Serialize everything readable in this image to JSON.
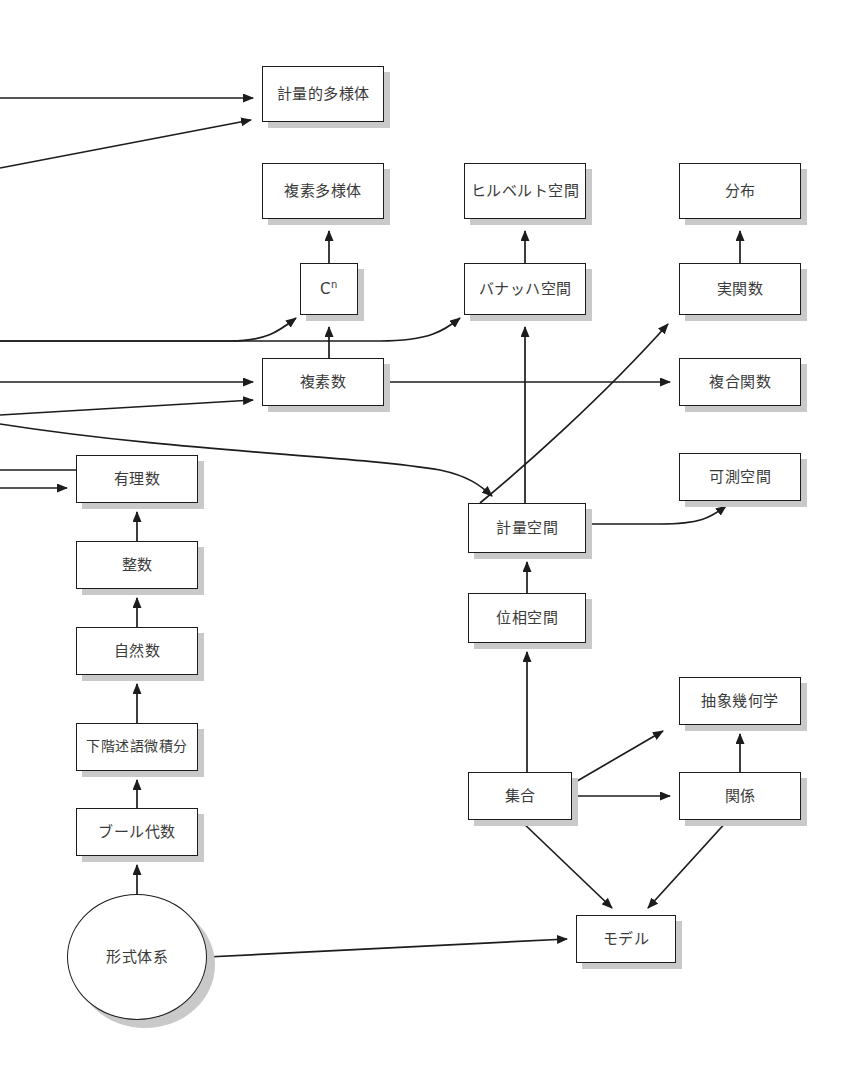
{
  "diagram": {
    "type": "dependency-graph",
    "language": "ja",
    "colors": {
      "node_fill": "#ffffff",
      "node_border": "#1c1c1c",
      "node_shadow": "#c9c9c9",
      "edge": "#1c1c1c",
      "text": "#3a3a3a",
      "background": "#ffffff"
    },
    "nodes": [
      {
        "id": "metric_manifold",
        "label": "計量的多様体",
        "shape": "rect",
        "x": 262,
        "y": 66,
        "w": 122,
        "h": 56
      },
      {
        "id": "complex_manifold",
        "label": "複素多様体",
        "shape": "rect",
        "x": 262,
        "y": 163,
        "w": 122,
        "h": 56
      },
      {
        "id": "hilbert_space",
        "label": "ヒルベルト空間",
        "shape": "rect",
        "x": 464,
        "y": 163,
        "w": 122,
        "h": 56
      },
      {
        "id": "distribution",
        "label": "分布",
        "shape": "rect",
        "x": 679,
        "y": 163,
        "w": 122,
        "h": 56
      },
      {
        "id": "cn",
        "label": "C",
        "sup": "n",
        "shape": "rect",
        "x": 300,
        "y": 263,
        "w": 58,
        "h": 52
      },
      {
        "id": "banach_space",
        "label": "バナッハ空間",
        "shape": "rect",
        "x": 464,
        "y": 263,
        "w": 122,
        "h": 52
      },
      {
        "id": "real_function",
        "label": "実関数",
        "shape": "rect",
        "x": 679,
        "y": 263,
        "w": 122,
        "h": 52
      },
      {
        "id": "complex_number",
        "label": "複素数",
        "shape": "rect",
        "x": 262,
        "y": 358,
        "w": 122,
        "h": 48
      },
      {
        "id": "composite_function",
        "label": "複合関数",
        "shape": "rect",
        "x": 679,
        "y": 358,
        "w": 122,
        "h": 48
      },
      {
        "id": "rational_number",
        "label": "有理数",
        "shape": "rect",
        "x": 76,
        "y": 455,
        "w": 122,
        "h": 48
      },
      {
        "id": "measurable_space",
        "label": "可測空間",
        "shape": "rect",
        "x": 679,
        "y": 453,
        "w": 122,
        "h": 48
      },
      {
        "id": "metric_space",
        "label": "計量空間",
        "shape": "rect",
        "x": 468,
        "y": 503,
        "w": 118,
        "h": 50
      },
      {
        "id": "integer",
        "label": "整数",
        "shape": "rect",
        "x": 76,
        "y": 541,
        "w": 122,
        "h": 48
      },
      {
        "id": "topological_space",
        "label": "位相空間",
        "shape": "rect",
        "x": 468,
        "y": 593,
        "w": 118,
        "h": 50
      },
      {
        "id": "natural_number",
        "label": "自然数",
        "shape": "rect",
        "x": 76,
        "y": 627,
        "w": 122,
        "h": 48
      },
      {
        "id": "abstract_geometry",
        "label": "抽象幾何学",
        "shape": "rect",
        "x": 679,
        "y": 677,
        "w": 122,
        "h": 48
      },
      {
        "id": "predicate_calculus",
        "label": "下階述語微積分",
        "shape": "rect",
        "x": 76,
        "y": 723,
        "w": 122,
        "h": 48
      },
      {
        "id": "set",
        "label": "集合",
        "shape": "rect",
        "x": 468,
        "y": 772,
        "w": 104,
        "h": 48
      },
      {
        "id": "relation",
        "label": "関係",
        "shape": "rect",
        "x": 679,
        "y": 772,
        "w": 122,
        "h": 48
      },
      {
        "id": "boolean_algebra",
        "label": "ブール代数",
        "shape": "rect",
        "x": 76,
        "y": 808,
        "w": 122,
        "h": 48
      },
      {
        "id": "formal_system",
        "label": "形式体系",
        "shape": "ellipse",
        "x": 67,
        "y": 894,
        "w": 140,
        "h": 126
      },
      {
        "id": "model",
        "label": "モデル",
        "shape": "rect",
        "x": 576,
        "y": 915,
        "w": 100,
        "h": 48
      }
    ],
    "edges": [
      {
        "from": "offscreen-left",
        "to": "metric_manifold",
        "style": "straight",
        "arrow": true
      },
      {
        "from": "offscreen-left",
        "to": "metric_manifold",
        "style": "straight",
        "arrow": true
      },
      {
        "from": "cn",
        "to": "complex_manifold",
        "style": "straight",
        "arrow": true
      },
      {
        "from": "banach_space",
        "to": "hilbert_space",
        "style": "straight",
        "arrow": true
      },
      {
        "from": "real_function",
        "to": "distribution",
        "style": "straight",
        "arrow": true
      },
      {
        "from": "complex_number",
        "to": "cn",
        "style": "straight",
        "arrow": true
      },
      {
        "from": "offscreen-left",
        "to": "cn",
        "style": "curve",
        "arrow": true
      },
      {
        "from": "offscreen-left",
        "to": "banach_space",
        "style": "curve",
        "arrow": true
      },
      {
        "from": "offscreen-left",
        "to": "complex_number",
        "style": "straight",
        "arrow": true
      },
      {
        "from": "offscreen-left",
        "to": "complex_number",
        "style": "straight",
        "arrow": true
      },
      {
        "from": "complex_number",
        "to": "composite_function",
        "style": "straight",
        "arrow": true
      },
      {
        "from": "metric_space",
        "to": "real_function",
        "style": "curve",
        "arrow": true
      },
      {
        "from": "offscreen-left",
        "to": "metric_space",
        "style": "curve",
        "arrow": true
      },
      {
        "from": "offscreen-left",
        "to": "rational_number",
        "style": "straight",
        "arrow": false
      },
      {
        "from": "offscreen-left",
        "to": "rational_number",
        "style": "straight",
        "arrow": true
      },
      {
        "from": "metric_space",
        "to": "measurable_space",
        "style": "curve",
        "arrow": true
      },
      {
        "from": "metric_space",
        "to": "banach_space",
        "style": "straight",
        "arrow": true
      },
      {
        "from": "integer",
        "to": "rational_number",
        "style": "straight",
        "arrow": true
      },
      {
        "from": "natural_number",
        "to": "integer",
        "style": "straight",
        "arrow": true
      },
      {
        "from": "topological_space",
        "to": "metric_space",
        "style": "straight",
        "arrow": true
      },
      {
        "from": "predicate_calculus",
        "to": "natural_number",
        "style": "straight",
        "arrow": true
      },
      {
        "from": "set",
        "to": "topological_space",
        "style": "straight",
        "arrow": true
      },
      {
        "from": "boolean_algebra",
        "to": "predicate_calculus",
        "style": "straight",
        "arrow": true
      },
      {
        "from": "formal_system",
        "to": "boolean_algebra",
        "style": "straight",
        "arrow": true
      },
      {
        "from": "set",
        "to": "abstract_geometry",
        "style": "straight",
        "arrow": true
      },
      {
        "from": "set",
        "to": "relation",
        "style": "straight",
        "arrow": true
      },
      {
        "from": "relation",
        "to": "abstract_geometry",
        "style": "straight",
        "arrow": true
      },
      {
        "from": "set",
        "to": "model",
        "style": "straight",
        "arrow": true
      },
      {
        "from": "relation",
        "to": "model",
        "style": "straight",
        "arrow": true
      },
      {
        "from": "formal_system",
        "to": "model",
        "style": "straight",
        "arrow": true
      }
    ]
  }
}
